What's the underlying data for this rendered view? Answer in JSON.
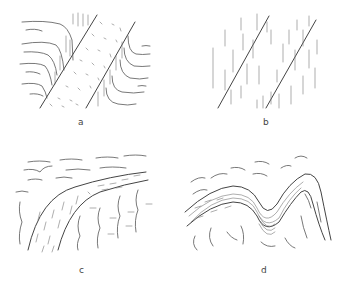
{
  "figure": {
    "panels": [
      {
        "id": "a",
        "label": "a",
        "description": "Band of dotted fabric between two parallel diagonal boundaries; wavy foliation traces curve into the boundaries from both sides"
      },
      {
        "id": "b",
        "label": "b",
        "description": "Two parallel diagonal shear planes with vertical dashed foliation traces that curve into the planes"
      },
      {
        "id": "c",
        "label": "c",
        "description": "Curved band sweeping from lower-left to upper-right with inclined dashes inside; wavy horizontal traces above and vertical wavy traces below"
      },
      {
        "id": "d",
        "label": "d",
        "description": "Folded layered band with antiform-synform shape; wavy traces surrounding and dense parallel lamination inside fold"
      }
    ]
  }
}
